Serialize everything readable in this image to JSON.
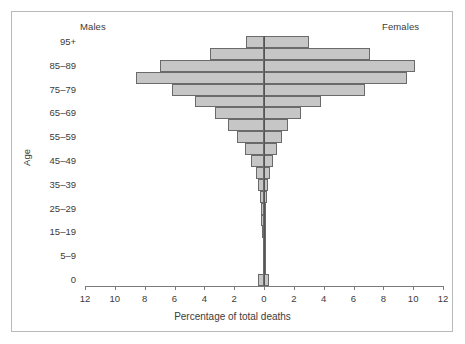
{
  "figure": {
    "males_label": "Males",
    "females_label": "Females"
  },
  "chart_data": {
    "type": "bar",
    "subtype": "population-pyramid",
    "title": "",
    "xlabel": "Percentage of total deaths",
    "ylabel": "Age",
    "categories": [
      "0",
      "1–4",
      "5–9",
      "10–14",
      "15–19",
      "20–24",
      "25–29",
      "30–34",
      "35–39",
      "40–44",
      "45–49",
      "50–54",
      "55–59",
      "60–64",
      "65–69",
      "70–74",
      "75–79",
      "80–84",
      "85–89",
      "90–94",
      "95+"
    ],
    "y_tick_labels": [
      "0",
      "5–9",
      "15–19",
      "25–29",
      "35–39",
      "45–49",
      "55–59",
      "65–69",
      "75–79",
      "85–89",
      "95+"
    ],
    "x_tick_labels": [
      "12",
      "10",
      "8",
      "6",
      "4",
      "2",
      "0",
      "2",
      "4",
      "6",
      "8",
      "10",
      "12"
    ],
    "x_tick_values": [
      -12,
      -10,
      -8,
      -6,
      -4,
      -2,
      0,
      2,
      4,
      6,
      8,
      10,
      12
    ],
    "xlim": [
      -12,
      12
    ],
    "grid": false,
    "legend": "none",
    "bar_fill": "#c6c6c6",
    "bar_edge": "#6a6a6a",
    "series": [
      {
        "name": "Males",
        "side": "left",
        "values": [
          0.4,
          0.05,
          0.03,
          0.04,
          0.12,
          0.18,
          0.2,
          0.28,
          0.38,
          0.55,
          0.85,
          1.25,
          1.8,
          2.4,
          3.3,
          4.6,
          6.2,
          8.6,
          7.0,
          3.6,
          1.2
        ]
      },
      {
        "name": "Females",
        "side": "right",
        "values": [
          0.35,
          0.04,
          0.02,
          0.03,
          0.07,
          0.1,
          0.12,
          0.18,
          0.26,
          0.4,
          0.6,
          0.85,
          1.2,
          1.6,
          2.5,
          3.8,
          6.8,
          9.6,
          10.1,
          7.1,
          3.0
        ]
      }
    ]
  }
}
